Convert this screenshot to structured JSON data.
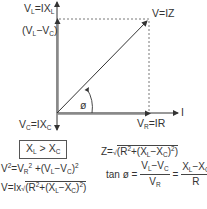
{
  "diagram": {
    "type": "RLC series circuit phasor diagram",
    "colors": {
      "line": "#333333",
      "thick_line": "#888888",
      "dashed": "#555555"
    },
    "labels": {
      "vl": "V_L=IX_L",
      "vl_minus_vc": "(V_L−V_C)",
      "v": "V=IZ",
      "phi": "ø",
      "vc": "V_C=IX_C",
      "vr": "V_R=IR",
      "current": "I"
    },
    "condition": "X_L > X_C",
    "equations": {
      "v_squared": "V² = V_R² + (V_L−V_C)²",
      "v_magnitude": "V = I × √(R² + (X_L−X_C)²)",
      "impedance": "Z = √(R² + (X_L−X_C)²)",
      "tan_phi": "tan ø = (V_L−V_C)/V_R = (X_L−X_C)/R"
    },
    "text": {
      "V": "V",
      "I": "I",
      "IX": "IX",
      "IR": "IR",
      "IZ": "IZ",
      "Z": "Z",
      "R": "R",
      "L": "L",
      "C": "C",
      "Rsub": "R",
      "X": "X",
      "tan": "tan ø",
      "eq": "=",
      "plus": "+",
      "minus": "−",
      "gt": ">",
      "two": "2",
      "Ix": "Ix"
    }
  }
}
